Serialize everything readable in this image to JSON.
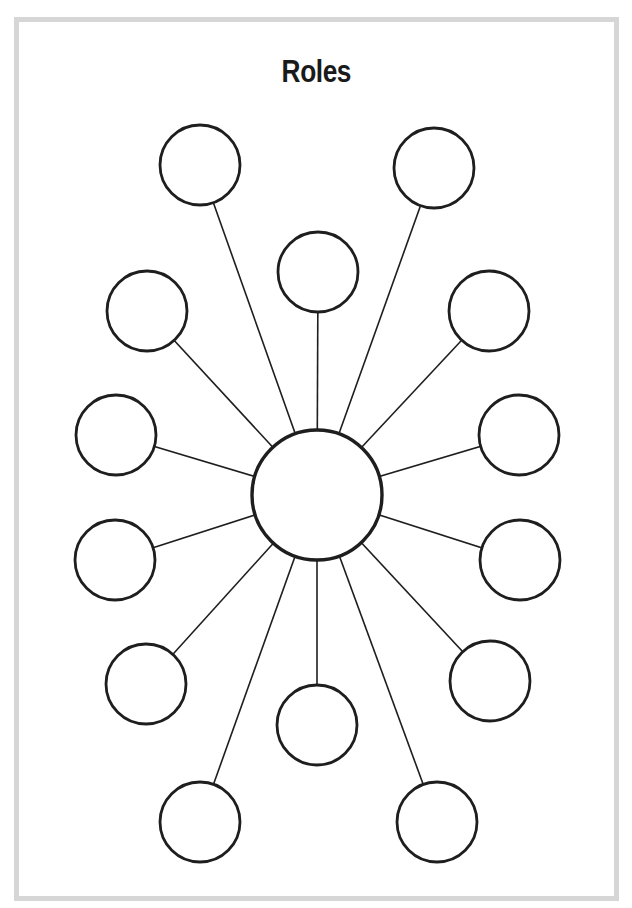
{
  "title": "Roles",
  "colors": {
    "frame_border": "#d6d6d6",
    "stroke": "#1e1e1e",
    "background": "#ffffff"
  },
  "diagram": {
    "type": "hub-and-spoke",
    "hub": {
      "id": "center",
      "cx": 317,
      "cy": 495,
      "r": 65,
      "label": ""
    },
    "nodes": [
      {
        "id": "top-left",
        "cx": 200,
        "cy": 165,
        "r": 40,
        "label": ""
      },
      {
        "id": "top-right",
        "cx": 434,
        "cy": 168,
        "r": 40,
        "label": ""
      },
      {
        "id": "top-center",
        "cx": 318,
        "cy": 272,
        "r": 40,
        "label": ""
      },
      {
        "id": "upper-left",
        "cx": 147,
        "cy": 311,
        "r": 40,
        "label": ""
      },
      {
        "id": "upper-right",
        "cx": 489,
        "cy": 311,
        "r": 40,
        "label": ""
      },
      {
        "id": "mid-upper-left",
        "cx": 116,
        "cy": 435,
        "r": 40,
        "label": ""
      },
      {
        "id": "mid-upper-right",
        "cx": 519,
        "cy": 435,
        "r": 40,
        "label": ""
      },
      {
        "id": "mid-lower-left",
        "cx": 115,
        "cy": 560,
        "r": 40,
        "label": ""
      },
      {
        "id": "mid-lower-right",
        "cx": 520,
        "cy": 560,
        "r": 40,
        "label": ""
      },
      {
        "id": "lower-left",
        "cx": 146,
        "cy": 684,
        "r": 40,
        "label": ""
      },
      {
        "id": "lower-right",
        "cx": 490,
        "cy": 681,
        "r": 40,
        "label": ""
      },
      {
        "id": "bottom-center",
        "cx": 317,
        "cy": 725,
        "r": 40,
        "label": ""
      },
      {
        "id": "bottom-left",
        "cx": 200,
        "cy": 822,
        "r": 40,
        "label": ""
      },
      {
        "id": "bottom-right",
        "cx": 437,
        "cy": 822,
        "r": 40,
        "label": ""
      }
    ]
  }
}
